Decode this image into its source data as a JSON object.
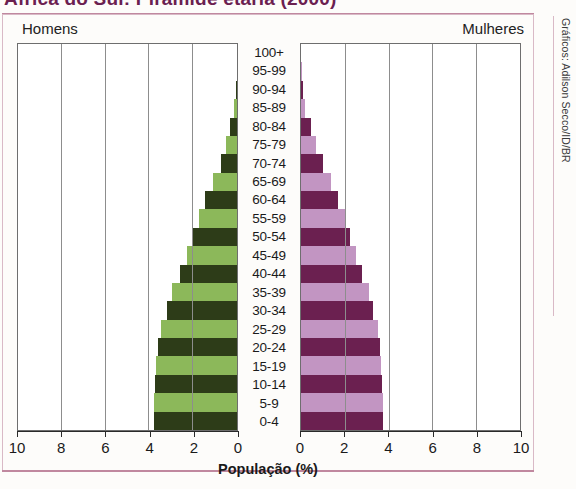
{
  "title": "África do Sul: Pirâmide etária (2000)",
  "credit": "Gráficos: Adilson Secco/ID/BR",
  "headers": {
    "left": "Homens",
    "right": "Mulheres"
  },
  "colors": {
    "male_light": "#8cb85a",
    "male_dark": "#2d3c18",
    "female_light": "#c295c2",
    "female_dark": "#6b2050",
    "axis": "#2a2a2a",
    "grid": "#8d8d8d",
    "frame": "#d9b9c6",
    "title": "#6b2050"
  },
  "chart_data": {
    "type": "bar",
    "title": "África do Sul: Pirâmide etária (2000)",
    "subtype": "population-pyramid",
    "xlabel": "População (%)",
    "ylabel": "",
    "xlim": [
      0,
      10
    ],
    "xticks": [
      10,
      8,
      6,
      4,
      2,
      0
    ],
    "xticks_right": [
      0,
      2,
      4,
      6,
      8,
      10
    ],
    "grid": true,
    "legend": [
      "Homens",
      "Mulheres"
    ],
    "categories": [
      "100+",
      "95-99",
      "90-94",
      "85-89",
      "80-84",
      "75-79",
      "70-74",
      "65-69",
      "60-64",
      "55-59",
      "50-54",
      "45-49",
      "40-44",
      "35-39",
      "30-34",
      "25-29",
      "20-24",
      "15-19",
      "10-14",
      "5-9",
      "0-4"
    ],
    "series": [
      {
        "name": "Homens",
        "values": [
          0.0,
          0.02,
          0.05,
          0.12,
          0.3,
          0.5,
          0.75,
          1.1,
          1.45,
          1.75,
          2.0,
          2.3,
          2.6,
          2.95,
          3.2,
          3.45,
          3.6,
          3.7,
          3.75,
          3.8,
          3.8
        ]
      },
      {
        "name": "Mulheres",
        "values": [
          0.0,
          0.03,
          0.08,
          0.2,
          0.45,
          0.7,
          1.0,
          1.35,
          1.7,
          2.0,
          2.25,
          2.5,
          2.8,
          3.1,
          3.3,
          3.5,
          3.6,
          3.65,
          3.7,
          3.75,
          3.75
        ]
      }
    ]
  }
}
